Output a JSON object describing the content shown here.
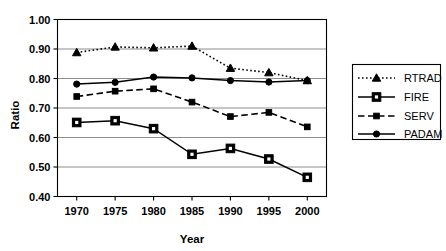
{
  "chart_data": {
    "type": "line",
    "title": "",
    "xlabel": "Year",
    "ylabel": "Ratio",
    "x": [
      1970,
      1975,
      1980,
      1985,
      1990,
      1995,
      2000
    ],
    "xtick_labels": [
      "1970",
      "1975",
      "1980",
      "1985",
      "1990",
      "1995",
      "2000"
    ],
    "ytick_labels": [
      "0.40",
      "0.50",
      "0.60",
      "0.70",
      "0.80",
      "0.90",
      "1.00"
    ],
    "ytick_values": [
      0.4,
      0.5,
      0.6,
      0.7,
      0.8,
      0.9,
      1.0
    ],
    "xlim": [
      1967.5,
      2002.5
    ],
    "ylim": [
      0.4,
      1.0
    ],
    "grid": "horizontal",
    "legend_position": "right",
    "series": [
      {
        "name": "RTRAD",
        "values": [
          0.888,
          0.907,
          0.904,
          0.91,
          0.835,
          0.82,
          0.793
        ],
        "line_style": "dotted",
        "marker": "triangle",
        "color": "#000000"
      },
      {
        "name": "FIRE",
        "values": [
          0.651,
          0.657,
          0.63,
          0.543,
          0.563,
          0.527,
          0.465
        ],
        "line_style": "solid",
        "marker": "square-open",
        "color": "#000000"
      },
      {
        "name": "SERV",
        "values": [
          0.739,
          0.757,
          0.765,
          0.72,
          0.671,
          0.685,
          0.636
        ],
        "line_style": "dashed",
        "marker": "square-small",
        "color": "#000000"
      },
      {
        "name": "PADAM",
        "values": [
          0.781,
          0.787,
          0.805,
          0.802,
          0.793,
          0.788,
          0.793
        ],
        "line_style": "solid",
        "marker": "circle",
        "color": "#000000"
      }
    ]
  },
  "legend": {
    "entries": [
      {
        "label": "RTRAD"
      },
      {
        "label": "FIRE"
      },
      {
        "label": "SERV"
      },
      {
        "label": "PADAM"
      }
    ]
  },
  "colors": {
    "ink": "#000000",
    "grid": "#808080",
    "background": "#ffffff"
  }
}
